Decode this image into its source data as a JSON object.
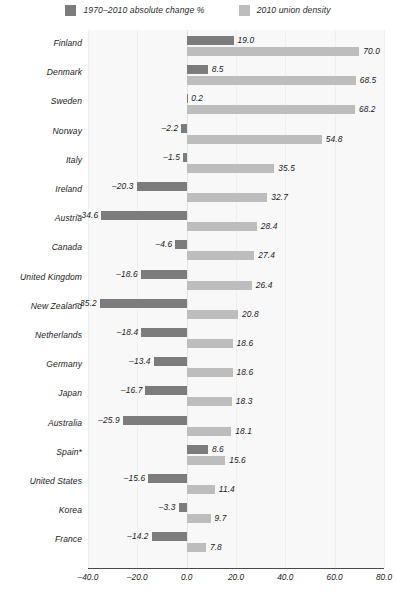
{
  "legend": {
    "items": [
      {
        "label": "1970–2010 absolute change %",
        "color": "#7c7c7c",
        "icon": "square-swatch-icon"
      },
      {
        "label": "2010 union density",
        "color": "#bdbdbd",
        "icon": "square-swatch-icon"
      }
    ]
  },
  "axis": {
    "ticks": [
      "–40.0",
      "–20.0",
      "0.0",
      "20.0",
      "40.0",
      "60.0",
      "80.0"
    ],
    "tick_values": [
      -40,
      -20,
      0,
      20,
      40,
      60,
      80
    ],
    "min": -40,
    "max": 80
  },
  "chart_data": {
    "type": "bar",
    "orientation": "horizontal",
    "title": "",
    "subtitle": "",
    "xlabel": "",
    "ylabel": "",
    "xlim": [
      -40,
      80
    ],
    "grid": true,
    "legend_position": "top-center",
    "categories": [
      "Finland",
      "Denmark",
      "Sweden",
      "Norway",
      "Italy",
      "Ireland",
      "Austria",
      "Canada",
      "United Kingdom",
      "New Zealand",
      "Netherlands",
      "Germany",
      "Japan",
      "Australia",
      "Spain*",
      "United States",
      "Korea",
      "France"
    ],
    "series": [
      {
        "name": "1970–2010 absolute change %",
        "color": "#7c7c7c",
        "values": [
          19.0,
          8.5,
          0.2,
          -2.2,
          -1.5,
          -20.3,
          -34.6,
          -4.6,
          -18.6,
          -35.2,
          -18.4,
          -13.4,
          -16.7,
          -25.9,
          8.6,
          -15.6,
          -3.3,
          -14.2
        ],
        "labels": [
          "19.0",
          "8.5",
          "0.2",
          "–2.2",
          "–1.5",
          "–20.3",
          "–34.6",
          "–4.6",
          "–18.6",
          "–35.2",
          "–18.4",
          "–13.4",
          "–16.7",
          "–25.9",
          "8.6",
          "–15.6",
          "–3.3",
          "–14.2"
        ]
      },
      {
        "name": "2010 union density",
        "color": "#bdbdbd",
        "values": [
          70.0,
          68.5,
          68.2,
          54.8,
          35.5,
          32.7,
          28.4,
          27.4,
          26.4,
          20.8,
          18.6,
          18.6,
          18.3,
          18.1,
          15.6,
          11.4,
          9.7,
          7.8
        ],
        "labels": [
          "70.0",
          "68.5",
          "68.2",
          "54.8",
          "35.5",
          "32.7",
          "28.4",
          "27.4",
          "26.4",
          "20.8",
          "18.6",
          "18.6",
          "18.3",
          "18.1",
          "15.6",
          "11.4",
          "9.7",
          "7.8"
        ]
      }
    ]
  }
}
